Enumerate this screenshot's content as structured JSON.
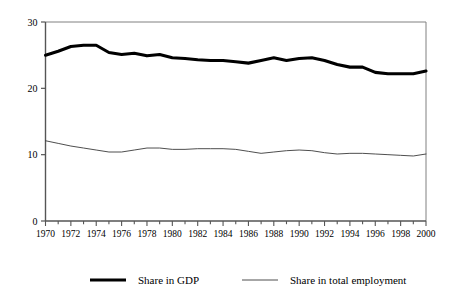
{
  "chart_data": {
    "type": "line",
    "title": "",
    "subtitle": "",
    "xlabel": "",
    "ylabel": "",
    "xlim": [
      1970,
      2000
    ],
    "ylim": [
      0,
      30
    ],
    "y_ticks": [
      "0",
      "10",
      "20",
      "30"
    ],
    "y_tick_values": [
      0,
      10,
      20,
      30
    ],
    "grid": false,
    "legend_position": "bottom",
    "x": [
      1970,
      1971,
      1972,
      1973,
      1974,
      1975,
      1976,
      1977,
      1978,
      1979,
      1980,
      1981,
      1982,
      1983,
      1984,
      1985,
      1986,
      1987,
      1988,
      1989,
      1990,
      1991,
      1992,
      1993,
      1994,
      1995,
      1996,
      1997,
      1998,
      1999,
      2000
    ],
    "x_tick_labels": [
      "1970",
      "1972",
      "1974",
      "1976",
      "1978",
      "1980",
      "1982",
      "1984",
      "1986",
      "1988",
      "1990",
      "1992",
      "1994",
      "1996",
      "1998",
      "2000"
    ],
    "x_tick_values": [
      1970,
      1972,
      1974,
      1976,
      1978,
      1980,
      1982,
      1984,
      1986,
      1988,
      1990,
      1992,
      1994,
      1996,
      1998,
      2000
    ],
    "series": [
      {
        "name": "Share in GDP",
        "color": "#000000",
        "line_width": 3.1,
        "values": [
          25.0,
          25.6,
          26.3,
          26.5,
          26.5,
          25.4,
          25.1,
          25.3,
          24.9,
          25.1,
          24.6,
          24.5,
          24.3,
          24.2,
          24.2,
          24.0,
          23.8,
          24.2,
          24.6,
          24.2,
          24.5,
          24.6,
          24.2,
          23.6,
          23.2,
          23.2,
          22.4,
          22.2,
          22.2,
          22.2,
          22.6
        ]
      },
      {
        "name": "Share in total employment",
        "color": "#3a3a3a",
        "line_width": 0.9,
        "values": [
          12.1,
          11.7,
          11.3,
          11.0,
          10.7,
          10.4,
          10.4,
          10.7,
          11.0,
          11.0,
          10.8,
          10.8,
          10.9,
          10.9,
          10.9,
          10.8,
          10.5,
          10.2,
          10.4,
          10.6,
          10.7,
          10.6,
          10.3,
          10.1,
          10.2,
          10.2,
          10.1,
          10.0,
          9.9,
          9.8,
          10.1
        ]
      }
    ],
    "legend": [
      {
        "label": "Share in GDP",
        "style": "thick",
        "color": "#000000"
      },
      {
        "label": "Share in total employment",
        "style": "thin",
        "color": "#3a3a3a"
      }
    ]
  }
}
